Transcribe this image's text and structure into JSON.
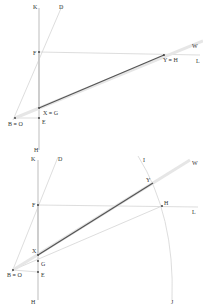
{
  "diagrams": [
    {
      "name": "top",
      "labels": {
        "K": "K",
        "D": "D",
        "F": "F",
        "W": "W",
        "YH": "Y ≡ H",
        "L": "L",
        "XG": "X ≡ G",
        "BO": "B ≡ O",
        "E": "E",
        "H": "H"
      }
    },
    {
      "name": "bottom",
      "labels": {
        "K": "K",
        "D": "D",
        "I": "I",
        "W": "W",
        "Y": "Y",
        "F": "F",
        "Hpt": "H",
        "L": "L",
        "X": "X",
        "G": "G",
        "BO": "B ≡ O",
        "E": "E",
        "H": "H",
        "J": "J"
      }
    }
  ],
  "colors": {
    "thick_segment": "#555555",
    "construction_lines": "#d4d4d4"
  }
}
